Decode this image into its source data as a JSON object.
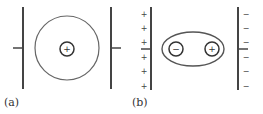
{
  "figure": {
    "panels": [
      {
        "id": "a",
        "label": "(a)",
        "description": "Isolated atom between uncharged plates: spherical electron cloud centered on the nucleus",
        "left_plate": {
          "x": 23,
          "y1": 7,
          "y2": 89,
          "stub": {
            "x1": 13,
            "x2": 23,
            "y": 48
          },
          "signs": []
        },
        "right_plate": {
          "x": 111,
          "y1": 7,
          "y2": 89,
          "stub": {
            "x1": 111,
            "x2": 121,
            "y": 48
          },
          "signs": []
        },
        "electron_cloud": {
          "shape": "circle",
          "cx": 67,
          "cy": 48,
          "r": 32
        },
        "charges": [
          {
            "cx": 67,
            "cy": 49,
            "r": 7,
            "sign": "+"
          }
        ]
      },
      {
        "id": "b",
        "label": "(b)",
        "description": "Polarized atom between charged plates: elongated cloud with separated charge centers",
        "left_plate": {
          "x": 151,
          "y1": 7,
          "y2": 90,
          "stub": {
            "x1": 141,
            "x2": 151,
            "y": 49
          },
          "signs": [
            "+",
            "+",
            "+",
            "+",
            "+",
            "+"
          ],
          "sign_x": 144
        },
        "right_plate": {
          "x": 238,
          "y1": 7,
          "y2": 90,
          "stub": {
            "x1": 238,
            "x2": 248,
            "y": 49
          },
          "signs": [
            "−",
            "−",
            "−",
            "−",
            "−",
            "−"
          ],
          "sign_x": 246
        },
        "sign_ys": [
          15,
          29,
          43,
          58,
          72,
          87
        ],
        "electron_cloud": {
          "shape": "ellipse",
          "cx": 193,
          "cy": 49,
          "rx": 31,
          "ry": 17
        },
        "charges": [
          {
            "cx": 176,
            "cy": 49,
            "r": 7,
            "sign": "−"
          },
          {
            "cx": 212,
            "cy": 49,
            "r": 7,
            "sign": "+"
          }
        ]
      }
    ],
    "colors": {
      "stroke": "#555555",
      "plate": "#444444",
      "text": "#333333"
    }
  }
}
